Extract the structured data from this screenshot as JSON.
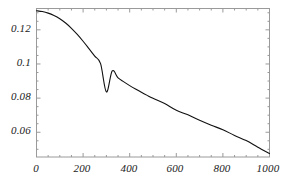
{
  "chart_data": {
    "type": "line",
    "title": "",
    "subtitle": "",
    "xlabel": "",
    "ylabel": "",
    "xlim": [
      0,
      1000
    ],
    "ylim": [
      0.0455,
      0.1325
    ],
    "grid": false,
    "legend": null,
    "frame": true,
    "xticks": [
      0,
      200,
      400,
      600,
      800,
      1000
    ],
    "xtick_labels": [
      "0",
      "200",
      "400",
      "600",
      "800",
      "1000"
    ],
    "yticks": [
      0.06,
      0.08,
      0.1,
      0.12
    ],
    "ytick_labels": [
      "0.06",
      "0.08",
      "0.1",
      "0.12"
    ],
    "xminor_step": 50,
    "yminor_step": 0.005,
    "series": [
      {
        "name": "curve",
        "color": "#111111",
        "linewidth": 1.1,
        "x": [
          0,
          25,
          50,
          75,
          100,
          125,
          150,
          175,
          200,
          225,
          250,
          275,
          300,
          325,
          350,
          375,
          400,
          425,
          450,
          475,
          500,
          550,
          600,
          650,
          700,
          750,
          800,
          850,
          900,
          950,
          1000
        ],
        "y": [
          0.1312,
          0.1307,
          0.1298,
          0.1284,
          0.1265,
          0.124,
          0.1209,
          0.1173,
          0.1133,
          0.109,
          0.1046,
          0.1002,
          0.0836,
          0.0959,
          0.0918,
          0.0895,
          0.0873,
          0.0853,
          0.0834,
          0.0816,
          0.0799,
          0.0768,
          0.0729,
          0.0702,
          0.067,
          0.0641,
          0.0615,
          0.0581,
          0.0551,
          0.0512,
          0.0475
        ]
      }
    ]
  },
  "axis": {
    "y_tick_values": [
      "0.12",
      "0.1",
      "0.08",
      "0.06"
    ],
    "x_tick_values": [
      "0",
      "200",
      "400",
      "600",
      "800",
      "1000"
    ]
  }
}
